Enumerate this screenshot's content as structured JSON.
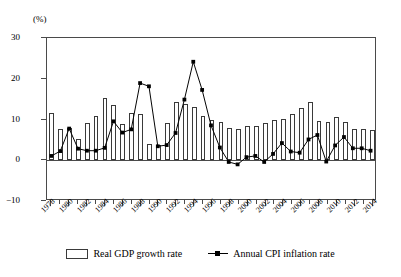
{
  "chart_data": {
    "type": "bar",
    "title": "",
    "subtitle": "",
    "xlabel": "",
    "ylabel": "",
    "unit_label": "(%)",
    "ylim": [
      -10,
      30
    ],
    "yticks": [
      30,
      20,
      10,
      0,
      -10
    ],
    "grid": false,
    "legend_position": "bottom",
    "x_tick_labels": [
      "1978",
      "1980",
      "1982",
      "1984",
      "1986",
      "1988",
      "1990",
      "1992",
      "1994",
      "1996",
      "1998",
      "2000",
      "2002",
      "2004",
      "2006",
      "2008",
      "2010",
      "2012",
      "2014"
    ],
    "categories": [
      1978,
      1979,
      1980,
      1981,
      1982,
      1983,
      1984,
      1985,
      1986,
      1987,
      1988,
      1989,
      1990,
      1991,
      1992,
      1993,
      1994,
      1995,
      1996,
      1997,
      1998,
      1999,
      2000,
      2001,
      2002,
      2003,
      2004,
      2005,
      2006,
      2007,
      2008,
      2009,
      2010,
      2011,
      2012,
      2013,
      2014
    ],
    "series": [
      {
        "name": "Real GDP growth rate",
        "render": "bar",
        "values": [
          11.7,
          7.6,
          7.8,
          5.2,
          9.1,
          10.9,
          15.2,
          13.5,
          8.8,
          11.6,
          11.3,
          4.1,
          3.8,
          9.2,
          14.2,
          13.9,
          13.1,
          10.9,
          10.0,
          9.3,
          7.8,
          7.6,
          8.4,
          8.3,
          9.1,
          10.0,
          10.1,
          11.4,
          12.7,
          14.2,
          9.7,
          9.4,
          10.6,
          9.5,
          7.7,
          7.7,
          7.4
        ]
      },
      {
        "name": "Annual CPI inflation rate",
        "render": "line-markers",
        "values": [
          0.7,
          1.9,
          7.5,
          2.5,
          2.0,
          2.0,
          2.7,
          9.3,
          6.5,
          7.3,
          18.8,
          18.0,
          3.1,
          3.4,
          6.4,
          14.7,
          24.1,
          17.1,
          8.3,
          2.8,
          -0.8,
          -1.4,
          0.4,
          0.7,
          -0.8,
          1.2,
          3.9,
          1.8,
          1.5,
          4.8,
          5.9,
          -0.7,
          3.3,
          5.4,
          2.6,
          2.6,
          2.0
        ]
      }
    ],
    "legend": [
      {
        "label": "Real GDP growth rate",
        "marker": "open-rectangle"
      },
      {
        "label": "Annual CPI inflation rate",
        "marker": "line-with-square"
      }
    ],
    "colors": {
      "bar_fill": "#ffffff",
      "bar_stroke": "#3a3a3a",
      "line": "#000000",
      "axis": "#4a4a4a"
    }
  }
}
